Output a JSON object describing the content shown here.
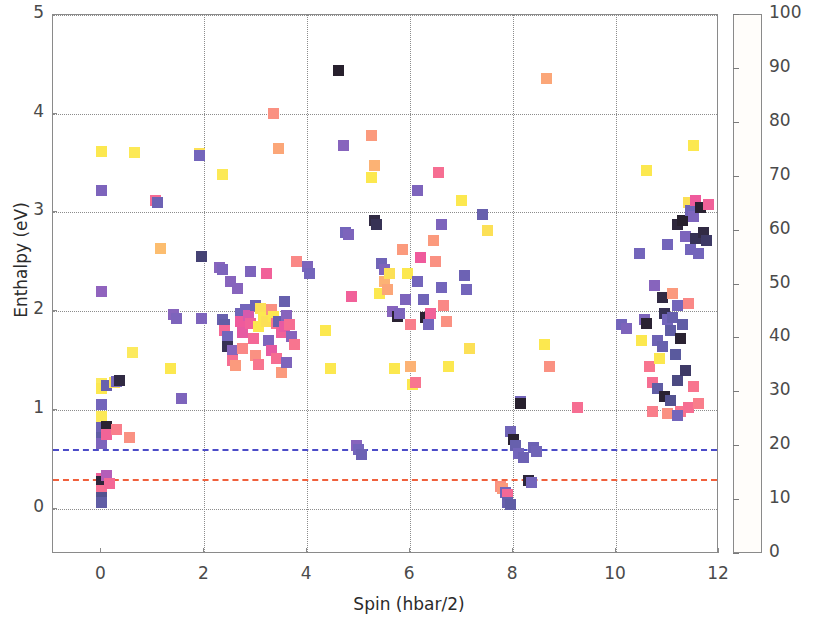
{
  "chart_data": {
    "type": "scatter",
    "title": "",
    "xlabel": "Spin (hbar/2)",
    "ylabel": "Enthalpy (eV)",
    "xlim": [
      -0.94,
      12.0
    ],
    "ylim": [
      -0.46,
      5.0
    ],
    "xticks": [
      0,
      2,
      4,
      6,
      8,
      10,
      12
    ],
    "yticks": [
      0,
      1,
      2,
      3,
      4,
      5
    ],
    "grid": true,
    "colorbar": {
      "label": "Generation",
      "ticks": [
        0,
        10,
        20,
        30,
        40,
        50,
        60,
        70,
        80,
        90,
        100
      ],
      "vmin": 0,
      "vmax": 100,
      "colormap": "magma_r",
      "stops": [
        {
          "pos": 0,
          "hex": "#fffdfa"
        },
        {
          "pos": 10,
          "hex": "#fdf18a"
        },
        {
          "pos": 18,
          "hex": "#fce84f"
        },
        {
          "pos": 26,
          "hex": "#fcc96a"
        },
        {
          "pos": 34,
          "hex": "#fb9a7d"
        },
        {
          "pos": 42,
          "hex": "#f8758f"
        },
        {
          "pos": 50,
          "hex": "#ef5a9c"
        },
        {
          "pos": 58,
          "hex": "#cd5ab3"
        },
        {
          "pos": 66,
          "hex": "#9a62bf"
        },
        {
          "pos": 74,
          "hex": "#7365bb"
        },
        {
          "pos": 82,
          "hex": "#5a5a9e"
        },
        {
          "pos": 90,
          "hex": "#3e3a66"
        },
        {
          "pos": 96,
          "hex": "#2a2232"
        },
        {
          "pos": 100,
          "hex": "#1d1a1c"
        }
      ]
    },
    "reference_lines": [
      {
        "name": "blue-dashdot-line",
        "y": 0.6,
        "style": "dashdot",
        "color": "#4b4bc8"
      },
      {
        "name": "red-dashed-line",
        "y": 0.3,
        "style": "dashed",
        "color": "#f0603c"
      }
    ],
    "series_name": "structures",
    "points": [
      [
        0.0,
        3.62,
        18
      ],
      [
        0.0,
        3.22,
        72
      ],
      [
        0.0,
        2.2,
        68
      ],
      [
        0.0,
        1.27,
        16
      ],
      [
        0.0,
        1.22,
        18
      ],
      [
        0.0,
        1.05,
        74
      ],
      [
        0.0,
        0.93,
        17
      ],
      [
        0.0,
        0.82,
        76
      ],
      [
        0.0,
        0.72,
        80
      ],
      [
        0.0,
        0.66,
        72
      ],
      [
        0.0,
        0.3,
        48
      ],
      [
        0.0,
        0.27,
        95
      ],
      [
        0.0,
        0.18,
        44
      ],
      [
        0.0,
        0.11,
        84
      ],
      [
        0.0,
        0.06,
        80
      ],
      [
        0.1,
        1.25,
        78
      ],
      [
        0.1,
        0.83,
        96
      ],
      [
        0.1,
        0.75,
        47
      ],
      [
        0.1,
        0.34,
        62
      ],
      [
        0.15,
        0.25,
        46
      ],
      [
        0.25,
        1.28,
        20
      ],
      [
        0.3,
        1.29,
        74
      ],
      [
        0.35,
        1.3,
        94
      ],
      [
        0.3,
        0.8,
        40
      ],
      [
        0.65,
        3.61,
        17
      ],
      [
        0.6,
        1.58,
        16
      ],
      [
        0.55,
        0.72,
        36
      ],
      [
        1.05,
        3.12,
        45
      ],
      [
        1.1,
        3.1,
        76
      ],
      [
        1.15,
        2.63,
        28
      ],
      [
        1.35,
        1.42,
        18
      ],
      [
        1.4,
        1.97,
        70
      ],
      [
        1.45,
        1.93,
        72
      ],
      [
        1.55,
        1.12,
        72
      ],
      [
        1.9,
        3.6,
        20
      ],
      [
        1.9,
        3.58,
        74
      ],
      [
        1.95,
        2.55,
        88
      ],
      [
        1.95,
        1.93,
        72
      ],
      [
        2.35,
        3.38,
        17
      ],
      [
        2.3,
        2.44,
        70
      ],
      [
        2.35,
        2.42,
        72
      ],
      [
        2.35,
        1.92,
        78
      ],
      [
        2.4,
        1.86,
        80
      ],
      [
        2.4,
        1.8,
        46
      ],
      [
        2.45,
        1.74,
        74
      ],
      [
        2.45,
        1.64,
        92
      ],
      [
        2.5,
        2.3,
        70
      ],
      [
        2.55,
        1.6,
        70
      ],
      [
        2.55,
        1.5,
        44
      ],
      [
        2.6,
        1.45,
        34
      ],
      [
        2.65,
        2.23,
        70
      ],
      [
        2.7,
        1.98,
        75
      ],
      [
        2.7,
        1.9,
        50
      ],
      [
        2.75,
        1.78,
        52
      ],
      [
        2.75,
        1.62,
        38
      ],
      [
        2.8,
        2.02,
        74
      ],
      [
        2.85,
        1.96,
        56
      ],
      [
        2.9,
        2.4,
        72
      ],
      [
        2.9,
        1.88,
        48
      ],
      [
        2.95,
        1.72,
        46
      ],
      [
        3.0,
        2.06,
        76
      ],
      [
        3.0,
        1.55,
        36
      ],
      [
        3.05,
        1.84,
        18
      ],
      [
        3.05,
        1.46,
        42
      ],
      [
        3.1,
        2.03,
        20
      ],
      [
        3.15,
        1.94,
        18
      ],
      [
        3.2,
        2.38,
        48
      ],
      [
        3.2,
        1.9,
        20
      ],
      [
        3.25,
        1.7,
        72
      ],
      [
        3.3,
        2.02,
        36
      ],
      [
        3.3,
        1.6,
        52
      ],
      [
        3.35,
        4.0,
        36
      ],
      [
        3.35,
        1.95,
        18
      ],
      [
        3.4,
        1.88,
        42
      ],
      [
        3.4,
        1.52,
        44
      ],
      [
        3.45,
        3.65,
        32
      ],
      [
        3.45,
        1.9,
        78
      ],
      [
        3.5,
        1.78,
        48
      ],
      [
        3.5,
        1.38,
        34
      ],
      [
        3.55,
        2.1,
        78
      ],
      [
        3.55,
        1.84,
        52
      ],
      [
        3.6,
        1.96,
        70
      ],
      [
        3.6,
        1.48,
        72
      ],
      [
        3.65,
        1.86,
        44
      ],
      [
        3.7,
        1.74,
        70
      ],
      [
        3.75,
        1.66,
        42
      ],
      [
        3.8,
        2.5,
        38
      ],
      [
        4.0,
        2.45,
        72
      ],
      [
        4.05,
        2.38,
        74
      ],
      [
        4.35,
        1.8,
        18
      ],
      [
        4.45,
        1.42,
        18
      ],
      [
        4.6,
        4.44,
        97
      ],
      [
        4.7,
        3.68,
        70
      ],
      [
        4.75,
        2.8,
        74
      ],
      [
        4.8,
        2.78,
        72
      ],
      [
        4.85,
        2.15,
        48
      ],
      [
        4.95,
        0.64,
        70
      ],
      [
        5.0,
        0.6,
        74
      ],
      [
        5.05,
        0.55,
        76
      ],
      [
        5.25,
        3.78,
        34
      ],
      [
        5.25,
        3.35,
        18
      ],
      [
        5.3,
        3.48,
        30
      ],
      [
        5.3,
        2.92,
        94
      ],
      [
        5.35,
        2.88,
        92
      ],
      [
        5.4,
        2.18,
        18
      ],
      [
        5.45,
        2.48,
        75
      ],
      [
        5.5,
        2.42,
        72
      ],
      [
        5.5,
        2.3,
        30
      ],
      [
        5.55,
        2.22,
        32
      ],
      [
        5.6,
        2.38,
        20
      ],
      [
        5.65,
        2.0,
        70
      ],
      [
        5.7,
        1.42,
        18
      ],
      [
        5.75,
        1.95,
        96
      ],
      [
        5.8,
        1.98,
        72
      ],
      [
        5.85,
        2.62,
        34
      ],
      [
        5.9,
        2.12,
        72
      ],
      [
        5.95,
        2.38,
        18
      ],
      [
        6.0,
        1.86,
        40
      ],
      [
        6.0,
        1.44,
        30
      ],
      [
        6.05,
        1.26,
        18
      ],
      [
        6.1,
        1.28,
        42
      ],
      [
        6.15,
        3.22,
        72
      ],
      [
        6.15,
        2.3,
        74
      ],
      [
        6.2,
        2.54,
        50
      ],
      [
        6.25,
        2.12,
        75
      ],
      [
        6.3,
        1.94,
        96
      ],
      [
        6.35,
        1.86,
        74
      ],
      [
        6.4,
        1.98,
        48
      ],
      [
        6.45,
        2.72,
        34
      ],
      [
        6.5,
        2.5,
        36
      ],
      [
        6.55,
        3.4,
        44
      ],
      [
        6.6,
        2.88,
        72
      ],
      [
        6.6,
        2.24,
        74
      ],
      [
        6.65,
        2.06,
        38
      ],
      [
        6.7,
        1.9,
        36
      ],
      [
        6.75,
        1.44,
        18
      ],
      [
        7.0,
        3.12,
        18
      ],
      [
        7.05,
        2.36,
        76
      ],
      [
        7.1,
        2.22,
        74
      ],
      [
        7.15,
        1.62,
        20
      ],
      [
        7.4,
        2.98,
        78
      ],
      [
        7.5,
        2.82,
        20
      ],
      [
        7.75,
        0.22,
        36
      ],
      [
        7.8,
        0.2,
        34
      ],
      [
        7.85,
        0.16,
        74
      ],
      [
        7.9,
        0.14,
        46
      ],
      [
        7.9,
        0.06,
        78
      ],
      [
        7.95,
        0.04,
        80
      ],
      [
        7.95,
        0.78,
        75
      ],
      [
        8.0,
        0.7,
        96
      ],
      [
        8.05,
        0.64,
        78
      ],
      [
        8.1,
        0.56,
        74
      ],
      [
        8.15,
        1.08,
        74
      ],
      [
        8.15,
        1.06,
        97
      ],
      [
        8.2,
        0.52,
        76
      ],
      [
        8.3,
        0.28,
        95
      ],
      [
        8.35,
        0.26,
        74
      ],
      [
        8.4,
        0.62,
        76
      ],
      [
        8.45,
        0.58,
        75
      ],
      [
        8.65,
        4.36,
        32
      ],
      [
        8.6,
        1.66,
        18
      ],
      [
        8.7,
        1.44,
        36
      ],
      [
        9.25,
        1.02,
        44
      ],
      [
        10.1,
        1.86,
        74
      ],
      [
        10.2,
        1.82,
        72
      ],
      [
        10.45,
        2.58,
        74
      ],
      [
        10.5,
        1.7,
        18
      ],
      [
        10.55,
        1.92,
        72
      ],
      [
        10.6,
        3.42,
        18
      ],
      [
        10.6,
        1.88,
        96
      ],
      [
        10.65,
        1.44,
        42
      ],
      [
        10.7,
        1.28,
        44
      ],
      [
        10.75,
        2.26,
        70
      ],
      [
        10.8,
        1.7,
        76
      ],
      [
        10.8,
        1.22,
        80
      ],
      [
        10.85,
        1.52,
        18
      ],
      [
        10.9,
        2.14,
        94
      ],
      [
        10.9,
        1.64,
        78
      ],
      [
        10.95,
        1.98,
        92
      ],
      [
        10.95,
        1.14,
        96
      ],
      [
        11.0,
        2.68,
        74
      ],
      [
        11.0,
        1.92,
        74
      ],
      [
        11.05,
        1.8,
        80
      ],
      [
        11.05,
        1.1,
        84
      ],
      [
        11.1,
        2.18,
        34
      ],
      [
        11.1,
        1.94,
        78
      ],
      [
        11.15,
        1.56,
        82
      ],
      [
        11.2,
        2.88,
        95
      ],
      [
        11.2,
        2.06,
        74
      ],
      [
        11.2,
        1.3,
        86
      ],
      [
        11.25,
        1.72,
        96
      ],
      [
        11.25,
        0.98,
        42
      ],
      [
        11.3,
        2.92,
        97
      ],
      [
        11.3,
        1.86,
        80
      ],
      [
        11.35,
        2.76,
        72
      ],
      [
        11.35,
        1.4,
        90
      ],
      [
        11.4,
        3.1,
        20
      ],
      [
        11.4,
        2.08,
        38
      ],
      [
        11.4,
        1.02,
        44
      ],
      [
        11.45,
        3.02,
        75
      ],
      [
        11.45,
        2.62,
        74
      ],
      [
        11.5,
        3.68,
        18
      ],
      [
        11.5,
        2.96,
        72
      ],
      [
        11.5,
        1.24,
        42
      ],
      [
        11.55,
        3.12,
        50
      ],
      [
        11.55,
        2.74,
        92
      ],
      [
        11.6,
        2.58,
        74
      ],
      [
        11.6,
        1.06,
        40
      ],
      [
        11.65,
        3.05,
        96
      ],
      [
        11.7,
        2.8,
        94
      ],
      [
        11.75,
        2.72,
        90
      ],
      [
        11.8,
        3.08,
        48
      ],
      [
        10.7,
        0.98,
        40
      ],
      [
        11.0,
        0.96,
        36
      ],
      [
        11.2,
        0.94,
        74
      ]
    ]
  },
  "axes": {
    "x_tick_labels": [
      "0",
      "2",
      "4",
      "6",
      "8",
      "10",
      "12"
    ],
    "y_tick_labels": [
      "0",
      "1",
      "2",
      "3",
      "4",
      "5"
    ],
    "xlabel": "Spin (hbar/2)",
    "ylabel": "Enthalpy (eV)"
  },
  "colorbar_ui": {
    "title": "Generation",
    "tick_labels": [
      "0",
      "10",
      "20",
      "30",
      "40",
      "50",
      "60",
      "70",
      "80",
      "90",
      "100"
    ]
  }
}
